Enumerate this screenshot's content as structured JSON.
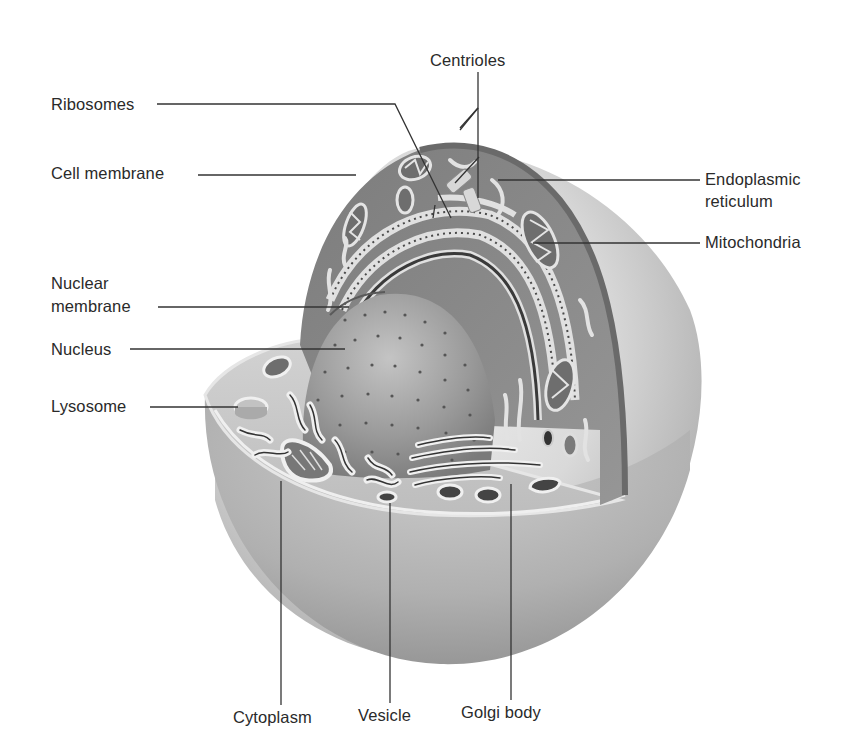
{
  "diagram": {
    "colors": {
      "background": "#ffffff",
      "label_text": "#2a2a2a",
      "leader_line": "#333333",
      "outer_sphere": "#d6d6d6",
      "cytoplasm_wall": "#8a8a8a",
      "cut_floor": "#c8c8c8",
      "nucleus": "#9a9a9a",
      "organelle_highlight": "#e8e8e8",
      "organelle_dark": "#3a3a3a"
    },
    "labels": {
      "centrioles": "Centrioles",
      "ribosomes": "Ribosomes",
      "cell_membrane": "Cell membrane",
      "endoplasmic_reticulum_line1": "Endoplasmic",
      "endoplasmic_reticulum_line2": "reticulum",
      "mitochondria": "Mitochondria",
      "nuclear_membrane_line1": "Nuclear",
      "nuclear_membrane_line2": "membrane",
      "nucleus": "Nucleus",
      "lysosome": "Lysosome",
      "cytoplasm": "Cytoplasm",
      "vesicle": "Vesicle",
      "golgi_body": "Golgi body"
    }
  }
}
